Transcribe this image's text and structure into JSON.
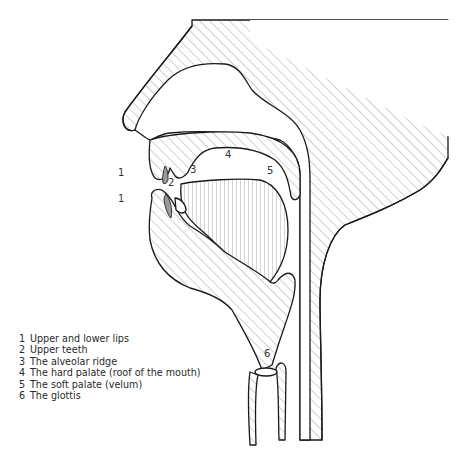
{
  "diagram": {
    "type": "sagittal cross-section of the vocal tract",
    "labels": [
      {
        "num": "1",
        "x": 118,
        "y": 175
      },
      {
        "num": "2",
        "x": 168,
        "y": 185
      },
      {
        "num": "3",
        "x": 190,
        "y": 172
      },
      {
        "num": "4",
        "x": 225,
        "y": 157
      },
      {
        "num": "5",
        "x": 267,
        "y": 173
      },
      {
        "num": "1",
        "x": 118,
        "y": 201
      },
      {
        "num": "6",
        "x": 264,
        "y": 356
      }
    ]
  },
  "legend": [
    {
      "num": "1",
      "text": "Upper and lower lips"
    },
    {
      "num": "2",
      "text": "Upper teeth"
    },
    {
      "num": "3",
      "text": "The alveolar ridge"
    },
    {
      "num": "4",
      "text": "The hard palate (roof of the mouth)"
    },
    {
      "num": "5",
      "text": "The soft palate (velum)"
    },
    {
      "num": "6",
      "text": "The glottis"
    }
  ]
}
